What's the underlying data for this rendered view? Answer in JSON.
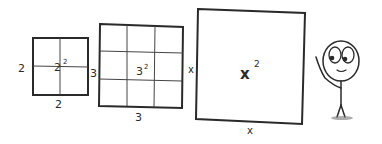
{
  "diagram": {
    "squares": [
      {
        "id": "two-squared",
        "side_label": "2",
        "bottom_label": "2",
        "area_base": "2",
        "area_exp": "2",
        "grid": 2
      },
      {
        "id": "three-squared",
        "side_label": "3",
        "bottom_label": "3",
        "area_base": "3",
        "area_exp": "2",
        "grid": 3
      },
      {
        "id": "x-squared",
        "side_label": "x",
        "bottom_label": "x",
        "area_base": "x",
        "area_exp": "2",
        "grid": 1
      }
    ],
    "figure": {
      "name": "stick-figure"
    },
    "colors": {
      "ink": "#2a2a2a",
      "background": "#ffffff"
    }
  }
}
